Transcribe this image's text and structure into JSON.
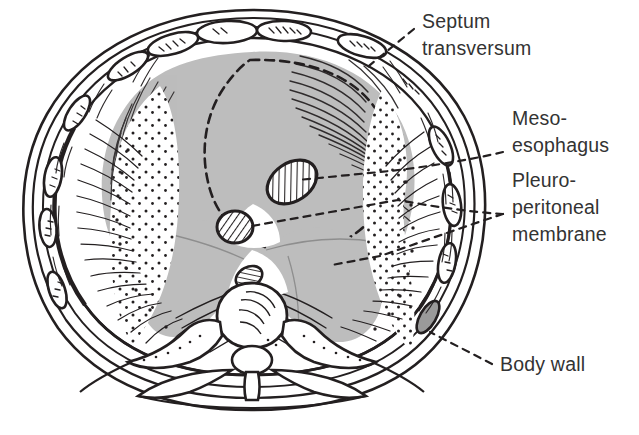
{
  "figure": {
    "background_color": "#ffffff",
    "ink_color": "#231f20",
    "fill_gray": "#bdbdbd",
    "fill_gray_light": "#c9c9c9",
    "text_color": "#333333"
  },
  "labels": [
    {
      "id": "septum-transversum",
      "lines": [
        "Septum",
        "transversum"
      ],
      "line1": "Septum",
      "line2": "transversum",
      "x": 422,
      "y": 22,
      "leader_from": [
        415,
        28
      ],
      "leader_to": [
        364,
        70
      ]
    },
    {
      "id": "meso-esophagus",
      "lines": [
        "Meso-",
        "esophagus"
      ],
      "line1": "Meso-",
      "line2": "esophagus",
      "x": 512,
      "y": 113,
      "leader_from": [
        505,
        152
      ],
      "leader_to": [
        287,
        182
      ]
    },
    {
      "id": "pleuro-peritoneal-membrane",
      "lines": [
        "Pleuro-",
        "peritoneal",
        "membrane"
      ],
      "line1": "Pleuro-",
      "line2": "peritoneal",
      "line3": "membrane",
      "x": 512,
      "y": 175,
      "leader_from": [
        505,
        214
      ],
      "leader_to_upper": [
        243,
        227
      ],
      "leader_to_lower": [
        330,
        265
      ]
    },
    {
      "id": "body-wall",
      "lines": [
        "Body wall"
      ],
      "line1": "Body wall",
      "x": 500,
      "y": 370,
      "leader_from": [
        494,
        364
      ],
      "leader_to": [
        430,
        332
      ]
    }
  ],
  "structures": [
    {
      "id": "body-wall-outline",
      "name": "body wall",
      "shading": "outline"
    },
    {
      "id": "ribs",
      "name": "rib cross-sections",
      "count": 12,
      "shading": "outline"
    },
    {
      "id": "septum-transversum-region",
      "name": "septum transversum",
      "shading": "gray-fill-dashed-border"
    },
    {
      "id": "pleuroperitoneal-membrane-left",
      "name": "left pleuroperitoneal membrane",
      "shading": "gray-fill"
    },
    {
      "id": "pleuroperitoneal-membrane-right",
      "name": "right pleuroperitoneal membrane",
      "shading": "gray-fill"
    },
    {
      "id": "esophagus",
      "name": "esophagus",
      "shading": "hatched-oval"
    },
    {
      "id": "aorta",
      "name": "aorta",
      "shading": "hatched-circle"
    },
    {
      "id": "vertebral-body",
      "name": "vertebral body",
      "shading": "outline"
    },
    {
      "id": "spinal-canal",
      "name": "spinal canal",
      "shading": "outline"
    },
    {
      "id": "lung-stipple-left",
      "name": "left pleural cavity stippling",
      "shading": "stipple"
    },
    {
      "id": "lung-stipple-right",
      "name": "right pleural cavity stippling",
      "shading": "stipple"
    }
  ]
}
